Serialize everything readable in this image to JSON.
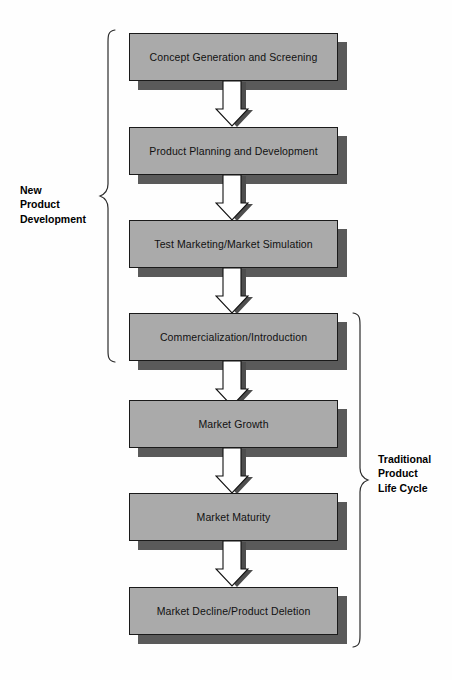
{
  "diagram": {
    "type": "flowchart",
    "orientation": "vertical",
    "colors": {
      "box_fill": "#aaaaaa",
      "box_border": "#1a1a1a",
      "box_shadow": "#5a5a5a",
      "arrow_fill": "#ffffff",
      "arrow_border": "#111111",
      "arrow_shadow": "#4d4d4d",
      "background": "#fefefe",
      "text": "#111111"
    },
    "nodes": [
      {
        "id": "concept",
        "label": "Concept Generation and Screening"
      },
      {
        "id": "planning",
        "label": "Product Planning and Development"
      },
      {
        "id": "test",
        "label": "Test Marketing/Market Simulation"
      },
      {
        "id": "commercial",
        "label": "Commercialization/Introduction"
      },
      {
        "id": "growth",
        "label": "Market Growth"
      },
      {
        "id": "maturity",
        "label": "Market Maturity"
      },
      {
        "id": "decline",
        "label": "Market Decline/Product Deletion"
      }
    ],
    "arrows": [
      {
        "from": "concept",
        "to": "planning",
        "style": "block-down"
      },
      {
        "from": "planning",
        "to": "test",
        "style": "block-down"
      },
      {
        "from": "test",
        "to": "commercial",
        "style": "block-down"
      },
      {
        "from": "commercial",
        "to": "growth",
        "style": "block-down"
      },
      {
        "from": "growth",
        "to": "maturity",
        "style": "block-down"
      },
      {
        "from": "maturity",
        "to": "decline",
        "style": "block-down"
      }
    ],
    "groups": [
      {
        "id": "new-product-development",
        "caption": "New\nProduct\nDevelopment",
        "side": "left",
        "covers": [
          "concept",
          "planning",
          "test",
          "commercial"
        ]
      },
      {
        "id": "traditional-product-life-cycle",
        "caption": "Traditional\nProduct\nLife Cycle",
        "side": "right",
        "covers": [
          "commercial",
          "growth",
          "maturity",
          "decline"
        ]
      }
    ]
  }
}
